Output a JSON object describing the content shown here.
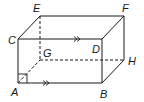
{
  "diagram": {
    "type": "rectangular-prism",
    "vertices": {
      "A": {
        "label": "A",
        "x": 18,
        "y": 83
      },
      "B": {
        "label": "B",
        "x": 102,
        "y": 83
      },
      "C": {
        "label": "C",
        "x": 18,
        "y": 39
      },
      "D": {
        "label": "D",
        "x": 102,
        "y": 39
      },
      "E": {
        "label": "E",
        "x": 40,
        "y": 16
      },
      "F": {
        "label": "F",
        "x": 124,
        "y": 16
      },
      "G": {
        "label": "G",
        "x": 40,
        "y": 60
      },
      "H": {
        "label": "H",
        "x": 124,
        "y": 60
      }
    },
    "visible_edges": [
      "AB",
      "AC",
      "CD",
      "BD",
      "CE",
      "EF",
      "DF",
      "FH",
      "BH"
    ],
    "hidden_edges": [
      "EG",
      "GH",
      "AG"
    ],
    "parallel_markers": [
      {
        "edge": "CD",
        "symbol": ">>"
      },
      {
        "edge": "AB",
        "symbol": ">>"
      }
    ],
    "right_angle_marker": {
      "vertex": "A"
    },
    "colors": {
      "stroke": "#1a1a1a",
      "background": "#ffffff"
    }
  }
}
